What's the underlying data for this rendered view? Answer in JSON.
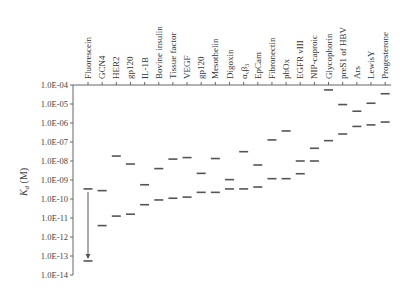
{
  "chart_data": {
    "type": "scatter",
    "title": "",
    "xlabel": "",
    "ylabel": "Kd (M)",
    "ylabel_main": "K",
    "ylabel_sub": "d",
    "ylabel_unit": " (M)",
    "yscale": "log",
    "ylim": [
      1e-14,
      0.0001
    ],
    "y_ticks": [
      "1.0E-04",
      "1.0E-05",
      "1.0E-06",
      "1.0E-07",
      "1.0E-08",
      "1.0E-09",
      "1.0E-10",
      "1.0E-11",
      "1.0E-12",
      "1.0E-13",
      "1.0E-14"
    ],
    "grid": false,
    "legend": null,
    "marker": "horizontal dash",
    "categories": [
      "Fluorescein",
      "GCN4",
      "HER2",
      "gp120",
      "IL-1B",
      "Bovine insulin",
      "Tissue factor",
      "VEGF",
      "gp120",
      "Mesothelin",
      "Digoxin",
      "αvβ3",
      "EpCam",
      "Fibronectin",
      "phOx",
      "EGFR vIII",
      "NIP-caproic",
      "Glycophorin",
      "preS1 of HBV",
      "Ars",
      "LewisY",
      "Progesterone"
    ],
    "series": [
      {
        "name": "upper (initial Kd)",
        "log10_values": [
          -9.47,
          -9.56,
          -7.74,
          -8.16,
          -9.25,
          -8.4,
          -7.9,
          -7.82,
          -8.65,
          -7.87,
          -8.98,
          -7.51,
          -8.21,
          -6.89,
          -6.42,
          -8.0,
          -7.33,
          -4.26,
          -5.03,
          -5.38,
          -4.96,
          -4.46
        ]
      },
      {
        "name": "lower (improved Kd)",
        "log10_values": [
          -13.26,
          -11.4,
          -10.9,
          -10.8,
          -10.3,
          -10.05,
          -9.96,
          -9.9,
          -9.65,
          -9.65,
          -9.47,
          -9.47,
          -9.37,
          -8.93,
          -8.93,
          -8.67,
          -8.0,
          -6.93,
          -6.58,
          -6.18,
          -6.1,
          -5.95
        ]
      }
    ],
    "annotations": [
      {
        "type": "arrow",
        "category": "Fluorescein",
        "from_log10": -9.47,
        "to_log10": -13.1,
        "direction": "down"
      }
    ]
  },
  "layout": {
    "axis_x": 73,
    "y_top": 85,
    "px_per_decade": 19,
    "col_start": 88,
    "col_step": 14.15,
    "dash_half": 4.5,
    "mark_color": "#555555",
    "axis_color": "#666666"
  }
}
